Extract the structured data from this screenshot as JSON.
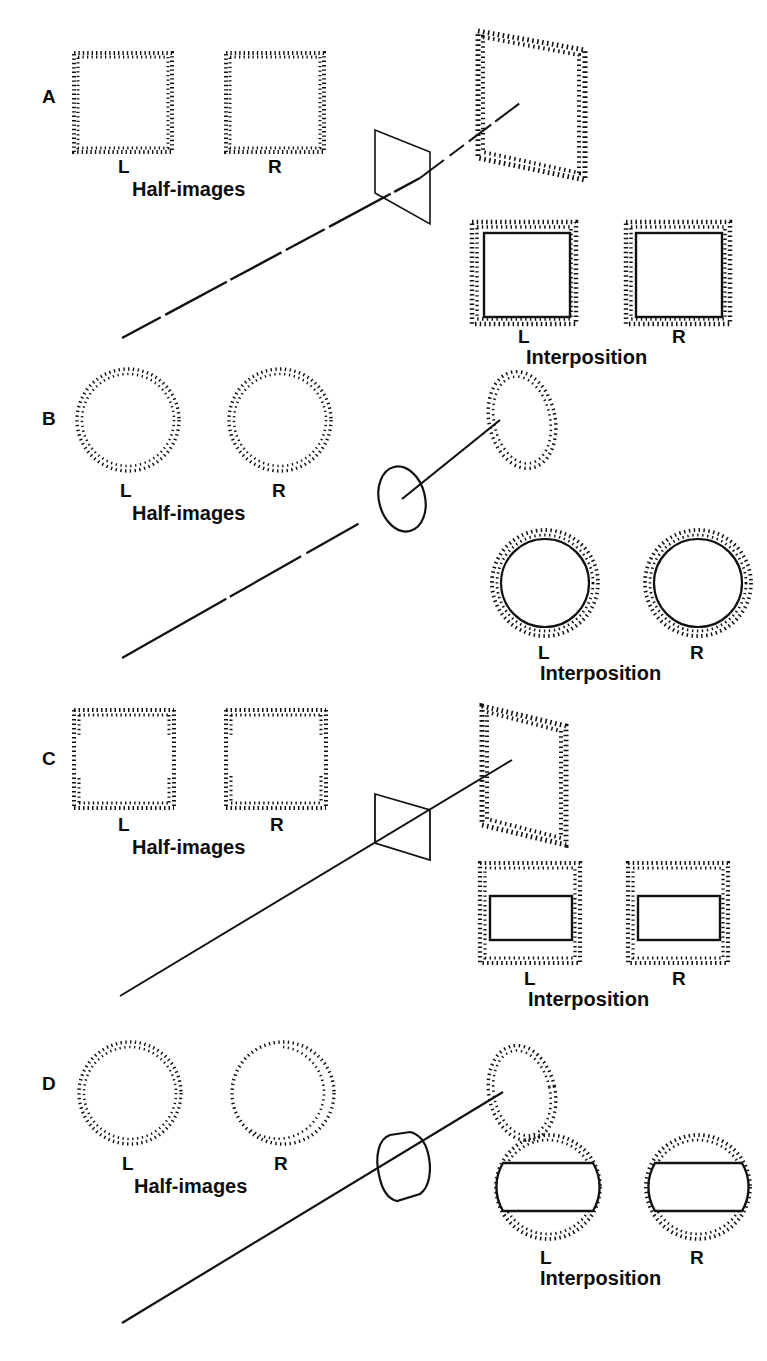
{
  "figure": {
    "background_color": "#ffffff",
    "ink_color": "#111111",
    "width": 767,
    "height": 1361
  },
  "common_labels": {
    "left_eye": "L",
    "right_eye": "R",
    "half_images": "Half-images",
    "interposition": "Interposition"
  },
  "rows": [
    {
      "id": "A",
      "label": "A",
      "half_images_caption": "Half-images",
      "interposition_caption": "Interposition",
      "left_label": "L",
      "right_label": "R",
      "half_image_shape": "dotted-square",
      "half_image_note": "dotted square outlines, no gaps",
      "scene_near_shape": "solid-quadrilateral-plane",
      "scene_far_shape": "dotted-parallelogram-plane",
      "scene_line": "dashed-diagonal-line",
      "interposition_shape": "solid-square-over-dotted-square",
      "interposition_left_label": "L",
      "interposition_right_label": "R"
    },
    {
      "id": "B",
      "label": "B",
      "half_images_caption": "Half-images",
      "interposition_caption": "Interposition",
      "left_label": "L",
      "right_label": "R",
      "half_image_shape": "dotted-circle",
      "half_image_note": "dotted circle outlines, no gaps",
      "scene_near_shape": "solid-ellipse-disk",
      "scene_far_shape": "dotted-ellipse",
      "scene_line": "solid-diagonal-line",
      "interposition_shape": "solid-circle-inside-dotted-circle",
      "interposition_left_label": "L",
      "interposition_right_label": "R"
    },
    {
      "id": "C",
      "label": "C",
      "half_images_caption": "Half-images",
      "interposition_caption": "Interposition",
      "left_label": "L",
      "right_label": "R",
      "half_image_shape": "dotted-square-with-side-gaps",
      "half_image_note": "dotted square with gaps in the vertical sides",
      "scene_near_shape": "solid-small-quadrilateral-plane",
      "scene_far_shape": "dotted-parallelogram-plane",
      "scene_line": "solid-diagonal-line",
      "interposition_shape": "solid-wide-rectangle-inside-dotted-square",
      "interposition_left_label": "L",
      "interposition_right_label": "R"
    },
    {
      "id": "D",
      "label": "D",
      "half_images_caption": "Half-images",
      "interposition_caption": "Interposition",
      "left_label": "L",
      "right_label": "R",
      "half_image_shape": "dotted-circle-with-arc-gap",
      "half_image_note": "dotted circle with a gap arc on one side",
      "scene_near_shape": "solid-barrel-lens-shape",
      "scene_far_shape": "dotted-ellipse",
      "scene_line": "solid-diagonal-line",
      "interposition_shape": "solid-barrel-inside-dotted-circle",
      "interposition_left_label": "L",
      "interposition_right_label": "R"
    }
  ]
}
